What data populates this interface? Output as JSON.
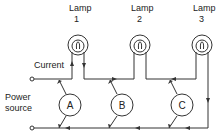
{
  "diagram": {
    "lamps": [
      {
        "id": "lamp-1",
        "label": "Lamp",
        "number": "1"
      },
      {
        "id": "lamp-2",
        "label": "Lamp",
        "number": "2"
      },
      {
        "id": "lamp-3",
        "label": "Lamp",
        "number": "3"
      }
    ],
    "meters": [
      {
        "id": "meter-a",
        "label": "A"
      },
      {
        "id": "meter-b",
        "label": "B"
      },
      {
        "id": "meter-c",
        "label": "C"
      }
    ],
    "labels": {
      "current": "Current",
      "power_line1": "Power",
      "power_line2": "source"
    },
    "colors": {
      "line": "#333333",
      "background": "#ffffff"
    }
  }
}
